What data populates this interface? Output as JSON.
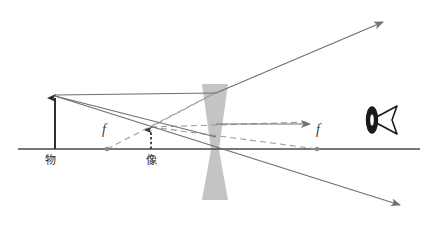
{
  "figure": {
    "kind": "optics-ray-diagram",
    "width": 434,
    "height": 228,
    "background_color": "#ffffff"
  },
  "colors": {
    "axis": "#4a4a4a",
    "ray_solid": "#6f6f76",
    "ray_dashed": "#9a9aa2",
    "lens_fill": "#bfbfbf",
    "object_arrow": "#2f2f2f",
    "image_arrow": "#3a3a3a",
    "focal_dot": "#7a7a82",
    "eye": "#1a1a1a",
    "label": "#2b2b2b"
  },
  "labels": {
    "object": "物",
    "image": "像",
    "focal_left": "f",
    "focal_right": "f"
  },
  "elements": {
    "optical_axis": {
      "name": "optical-axis",
      "x1": 18,
      "y1": 149,
      "x2": 420,
      "y2": 149
    },
    "lens": {
      "name": "concave-lens",
      "center_x": 215,
      "top_y": 84,
      "bottom_y": 200,
      "edge_half_width": 13,
      "waist_half_width": 4
    },
    "object": {
      "name": "object-arrow",
      "x": 55,
      "base_y": 149,
      "tip_y": 95,
      "label_x": 50,
      "label_y": 163
    },
    "image": {
      "name": "image-arrow",
      "x": 151,
      "base_y": 149,
      "tip_y": 127,
      "label_x": 145,
      "label_y": 163
    },
    "focal_left": {
      "name": "focal-point-left",
      "dot_x": 107,
      "dot_y": 149,
      "label_x": 101,
      "label_y": 133
    },
    "focal_right": {
      "name": "focal-point-right",
      "dot_x": 317,
      "dot_y": 149,
      "label_x": 314,
      "label_y": 133
    },
    "eye": {
      "name": "observer-eye",
      "x": 366,
      "y": 103,
      "width": 32,
      "height": 34
    }
  },
  "rays": [
    {
      "name": "ray-parallel-incident",
      "style": "solid",
      "points": "55,95 215,93",
      "arrow": false
    },
    {
      "name": "ray-parallel-refracted",
      "style": "solid",
      "points": "215,93 383,22",
      "arrow": true
    },
    {
      "name": "ray-parallel-virtual-extension",
      "style": "dashed",
      "points": "215,93 151,127",
      "arrow": false
    },
    {
      "name": "ray-through-center",
      "style": "solid",
      "points": "55,96 400,205",
      "arrow": true
    },
    {
      "name": "ray-toward-far-focus-incident",
      "style": "solid",
      "points": "55,96 215,137",
      "arrow": false
    },
    {
      "name": "ray-toward-far-focus-refracted",
      "style": "solid",
      "points": "215,137 310,125",
      "arrow": true
    },
    {
      "name": "ray-far-focus-virtual-extension",
      "style": "dashed",
      "points": "151,127 317,149",
      "arrow": false
    },
    {
      "name": "ray-near-focus-construction",
      "style": "dashed",
      "points": "107,149 215,93",
      "arrow": false
    },
    {
      "name": "ray-image-to-lens-construction",
      "style": "dashed",
      "points": "151,127 310,122",
      "arrow": false
    }
  ]
}
